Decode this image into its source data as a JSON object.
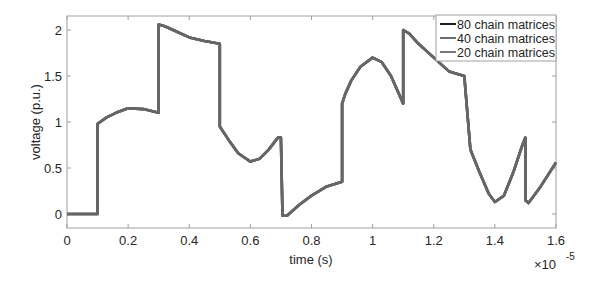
{
  "chart_data": {
    "type": "line",
    "title": "",
    "xlabel": "time (s)",
    "ylabel": "voltage (p.u.)",
    "x_multiplier_label": "×10",
    "x_multiplier_exponent": "-5",
    "xlim": [
      0,
      1.6
    ],
    "ylim": [
      -0.15,
      2.15
    ],
    "x_ticks": [
      0,
      0.2,
      0.4,
      0.6,
      0.8,
      1,
      1.2,
      1.4,
      1.6
    ],
    "x_tick_labels": [
      "0",
      "0.2",
      "0.4",
      "0.6",
      "0.8",
      "1",
      "1.2",
      "1.4",
      "1.6"
    ],
    "y_ticks": [
      0,
      0.5,
      1,
      1.5,
      2
    ],
    "y_tick_labels": [
      "0",
      "0.5",
      "1",
      "1.5",
      "2"
    ],
    "grid": false,
    "legend_position": "upper right",
    "series": [
      {
        "name": "80 chain matrices",
        "color": "#1a1a1a",
        "x": [
          0,
          0.1,
          0.1,
          0.13,
          0.16,
          0.2,
          0.25,
          0.3,
          0.3,
          0.32,
          0.36,
          0.4,
          0.45,
          0.5,
          0.5,
          0.51,
          0.53,
          0.56,
          0.6,
          0.63,
          0.66,
          0.69,
          0.7,
          0.705,
          0.72,
          0.76,
          0.8,
          0.85,
          0.9,
          0.9,
          0.91,
          0.93,
          0.96,
          1.0,
          1.03,
          1.06,
          1.1,
          1.1,
          1.12,
          1.15,
          1.2,
          1.25,
          1.3,
          1.3,
          1.32,
          1.35,
          1.38,
          1.4,
          1.43,
          1.46,
          1.49,
          1.5,
          1.5,
          1.51,
          1.55,
          1.6
        ],
        "y": [
          0,
          0,
          0.98,
          1.05,
          1.1,
          1.15,
          1.14,
          1.1,
          2.06,
          2.04,
          1.98,
          1.92,
          1.88,
          1.85,
          0.95,
          0.9,
          0.8,
          0.66,
          0.57,
          0.6,
          0.7,
          0.83,
          0.83,
          -0.02,
          -0.02,
          0.1,
          0.2,
          0.3,
          0.35,
          1.2,
          1.3,
          1.45,
          1.6,
          1.7,
          1.65,
          1.5,
          1.2,
          2.0,
          1.96,
          1.85,
          1.7,
          1.55,
          1.5,
          1.5,
          0.7,
          0.45,
          0.22,
          0.13,
          0.2,
          0.45,
          0.75,
          0.83,
          0.15,
          0.12,
          0.3,
          0.56
        ]
      },
      {
        "name": "40 chain matrices",
        "color": "#6e6e6e",
        "same_as": "80 chain matrices"
      },
      {
        "name": "20 chain matrices",
        "color": "#7a7a7a",
        "same_as": "80 chain matrices"
      }
    ]
  },
  "legend": {
    "items": [
      {
        "label": "80 chain matrices",
        "color": "#1a1a1a"
      },
      {
        "label": "40 chain matrices",
        "color": "#6e6e6e"
      },
      {
        "label": "20 chain matrices",
        "color": "#7a7a7a"
      }
    ]
  },
  "style": {
    "line_color": "#666666",
    "axis_color": "#262626",
    "box_color": "#a0a0a0"
  }
}
